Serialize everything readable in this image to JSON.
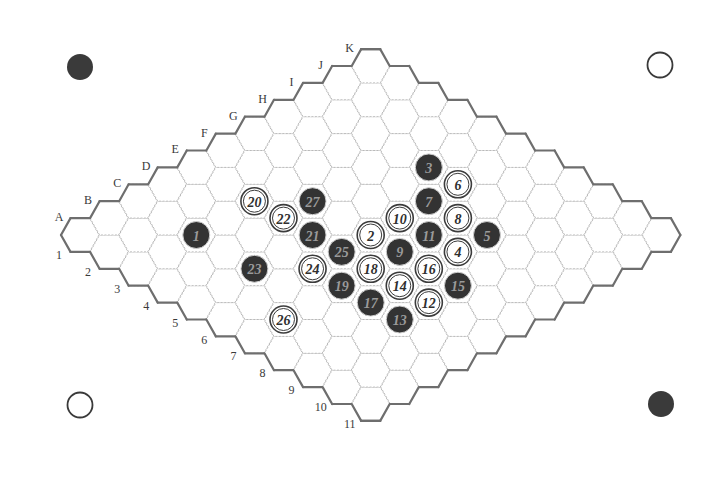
{
  "board": {
    "size": 11,
    "origin": {
      "x": 80,
      "y": 235
    },
    "step": {
      "dx": 29.07,
      "dy": 16.9
    },
    "hex_radius": 19,
    "letters": [
      "A",
      "B",
      "C",
      "D",
      "E",
      "F",
      "G",
      "H",
      "I",
      "J",
      "K"
    ],
    "numbers": [
      "1",
      "2",
      "3",
      "4",
      "5",
      "6",
      "7",
      "8",
      "9",
      "10",
      "11"
    ],
    "colors": {
      "black": "#333333",
      "white": "#ffffff",
      "edge": "#6e6e6e",
      "grid": "#b9b9b9"
    }
  },
  "corner_markers": [
    {
      "position": "top-left",
      "color": "black",
      "x": 80,
      "y": 67
    },
    {
      "position": "top-right",
      "color": "white",
      "x": 660,
      "y": 65
    },
    {
      "position": "bottom-left",
      "color": "white",
      "x": 80,
      "y": 405
    },
    {
      "position": "bottom-right",
      "color": "black",
      "x": 661,
      "y": 404
    }
  ],
  "moves": [
    {
      "n": "1",
      "color": "black",
      "cell": "C3"
    },
    {
      "n": "2",
      "color": "white",
      "cell": "F6"
    },
    {
      "n": "3",
      "color": "black",
      "cell": "I5"
    },
    {
      "n": "4",
      "color": "white",
      "cell": "G8"
    },
    {
      "n": "5",
      "color": "black",
      "cell": "H8"
    },
    {
      "n": "6",
      "color": "white",
      "cell": "I6"
    },
    {
      "n": "7",
      "color": "black",
      "cell": "H6"
    },
    {
      "n": "8",
      "color": "white",
      "cell": "H7"
    },
    {
      "n": "9",
      "color": "black",
      "cell": "F7"
    },
    {
      "n": "10",
      "color": "white",
      "cell": "G6"
    },
    {
      "n": "11",
      "color": "black",
      "cell": "G7"
    },
    {
      "n": "12",
      "color": "white",
      "cell": "E9"
    },
    {
      "n": "13",
      "color": "black",
      "cell": "D9"
    },
    {
      "n": "14",
      "color": "white",
      "cell": "E8"
    },
    {
      "n": "15",
      "color": "black",
      "cell": "F9"
    },
    {
      "n": "16",
      "color": "white",
      "cell": "F8"
    },
    {
      "n": "17",
      "color": "black",
      "cell": "D8"
    },
    {
      "n": "18",
      "color": "white",
      "cell": "E7"
    },
    {
      "n": "19",
      "color": "black",
      "cell": "D7"
    },
    {
      "n": "20",
      "color": "white",
      "cell": "E3"
    },
    {
      "n": "21",
      "color": "black",
      "cell": "E5"
    },
    {
      "n": "22",
      "color": "white",
      "cell": "E4"
    },
    {
      "n": "23",
      "color": "black",
      "cell": "C5"
    },
    {
      "n": "24",
      "color": "white",
      "cell": "D6"
    },
    {
      "n": "25",
      "color": "black",
      "cell": "E6"
    },
    {
      "n": "26",
      "color": "white",
      "cell": "B7"
    },
    {
      "n": "27",
      "color": "black",
      "cell": "F4"
    }
  ]
}
